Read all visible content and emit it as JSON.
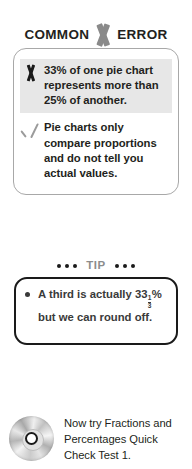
{
  "common_error": {
    "header": {
      "left_word": "COMMON",
      "right_word": "ERROR",
      "icon": "x-cross-icon"
    },
    "rows": [
      {
        "mark": "x-mark-icon",
        "mark_type": "incorrect",
        "text": "33% of one pie chart represents more than 25% of another.",
        "shaded": true
      },
      {
        "mark": "check-mark-icon",
        "mark_type": "correct",
        "text": "Pie charts only compare proportions and do not tell you actual values.",
        "shaded": false
      }
    ]
  },
  "tip": {
    "header_label": "TIP",
    "dot_count": 3,
    "bullet_text_before": "A third is actually 33",
    "fraction_numerator": "1",
    "fraction_denominator": "3",
    "bullet_text_after": "% but we can round off."
  },
  "footer": {
    "icon": "cd-disc-icon",
    "text": "Now try Fractions and Percentages Quick Check Test 1."
  },
  "colors": {
    "background": "#ffffff",
    "text": "#231f20",
    "muted_gray": "#8c8c8c",
    "shade_band": "#e7e7e7",
    "box_border_gray": "#a8a8a8",
    "box_border_black": "#1a1a1a"
  }
}
